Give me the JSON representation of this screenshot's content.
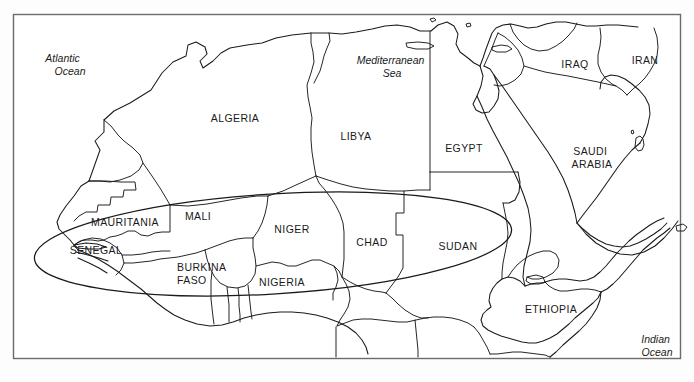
{
  "figure": {
    "frame_color": "#6b6b6b",
    "line_color": "#1a1a1a",
    "background_color": "#ffffff"
  },
  "highlight": {
    "name": "sahel-region-ellipse",
    "shape": "ellipse",
    "cx": 273,
    "cy": 244,
    "rx": 239,
    "ry": 50,
    "rotation_deg": -3.5,
    "stroke": "#1a1a1a"
  },
  "countries": [
    {
      "name": "algeria",
      "label": "ALGERIA",
      "x": 235,
      "y": 119,
      "lines": [
        "ALGERIA"
      ]
    },
    {
      "name": "libya",
      "label": "LIBYA",
      "x": 356,
      "y": 137,
      "lines": [
        "LIBYA"
      ]
    },
    {
      "name": "egypt",
      "label": "EGYPT",
      "x": 464,
      "y": 149,
      "lines": [
        "EGYPT"
      ]
    },
    {
      "name": "iraq",
      "label": "IRAQ",
      "x": 575,
      "y": 65,
      "lines": [
        "IRAQ"
      ]
    },
    {
      "name": "iran",
      "label": "IRAN",
      "x": 645,
      "y": 61,
      "lines": [
        "IRAN"
      ]
    },
    {
      "name": "saudi-arabia",
      "label": "SAUDI ARABIA",
      "x": 592,
      "y": 152,
      "lines": [
        "SAUDI",
        "ARABIA"
      ]
    },
    {
      "name": "mauritania",
      "label": "MAURITANIA",
      "x": 125,
      "y": 223,
      "lines": [
        "MAURITANIA"
      ]
    },
    {
      "name": "mali",
      "label": "MALI",
      "x": 198,
      "y": 217,
      "lines": [
        "MALI"
      ]
    },
    {
      "name": "niger",
      "label": "NIGER",
      "x": 292,
      "y": 230,
      "lines": [
        "NIGER"
      ]
    },
    {
      "name": "chad",
      "label": "CHAD",
      "x": 372,
      "y": 243,
      "lines": [
        "CHAD"
      ]
    },
    {
      "name": "sudan",
      "label": "SUDAN",
      "x": 458,
      "y": 247,
      "lines": [
        "SUDAN"
      ]
    },
    {
      "name": "senegal",
      "label": "SENEGAL",
      "x": 96,
      "y": 251,
      "lines": [
        "SENEGAL"
      ]
    },
    {
      "name": "burkina-faso",
      "label": "BURKINA FASO",
      "x": 200,
      "y": 268,
      "lines": [
        "BURKINA",
        "FASO"
      ]
    },
    {
      "name": "nigeria",
      "label": "NIGERIA",
      "x": 282,
      "y": 283,
      "lines": [
        "NIGERIA"
      ]
    },
    {
      "name": "ethiopia",
      "label": "ETHIOPIA",
      "x": 551,
      "y": 310,
      "lines": [
        "ETHIOPIA"
      ]
    }
  ],
  "waters": [
    {
      "name": "atlantic-ocean",
      "label": "Atlantic Ocean",
      "x": 64,
      "y": 59,
      "lines": [
        "Atlantic",
        "Ocean"
      ]
    },
    {
      "name": "mediterranean-sea",
      "label": "Mediterranean Sea",
      "x": 392,
      "y": 61,
      "lines": [
        "Mediterranean",
        "Sea"
      ]
    },
    {
      "name": "indian-ocean",
      "label": "Indian Ocean",
      "x": 657,
      "y": 340,
      "lines": [
        "Indian",
        "Ocean"
      ]
    }
  ]
}
